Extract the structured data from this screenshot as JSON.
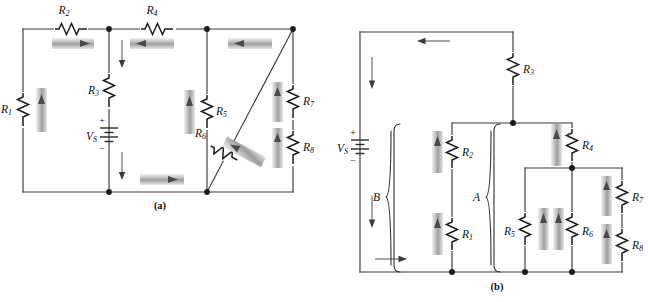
{
  "figure": {
    "panels": [
      {
        "id": "panel-a",
        "caption": "(a)",
        "source_label": "V",
        "source_sub": "S",
        "source_plus": "+",
        "source_minus": "−",
        "components": [
          {
            "name": "R1",
            "label": "R",
            "sub": "1",
            "current_direction": "up"
          },
          {
            "name": "R2",
            "label": "R",
            "sub": "2",
            "current_direction": "right"
          },
          {
            "name": "R3",
            "label": "R",
            "sub": "3",
            "current_direction": "down"
          },
          {
            "name": "R4",
            "label": "R",
            "sub": "4",
            "current_direction": "left"
          },
          {
            "name": "R5",
            "label": "R",
            "sub": "5",
            "current_direction": "up"
          },
          {
            "name": "R6",
            "label": "R",
            "sub": "6",
            "current_direction": "diagonal-up-right"
          },
          {
            "name": "R7",
            "label": "R",
            "sub": "7",
            "current_direction": "up"
          },
          {
            "name": "R8",
            "label": "R",
            "sub": "8",
            "current_direction": "up"
          }
        ],
        "branch_arrows": [
          {
            "name": "top-left-branch-arrow",
            "direction": "right"
          },
          {
            "name": "top-middle-branch-arrow",
            "direction": "left"
          },
          {
            "name": "top-right-branch-arrow",
            "direction": "left"
          },
          {
            "name": "bottom-middle-branch-arrow",
            "direction": "right"
          },
          {
            "name": "r3-upper-current-arrow",
            "direction": "down"
          },
          {
            "name": "r3-lower-current-arrow",
            "direction": "down"
          }
        ]
      },
      {
        "id": "panel-b",
        "caption": "(b)",
        "source_label": "V",
        "source_sub": "S",
        "source_plus": "+",
        "source_minus": "−",
        "group_labels": [
          {
            "name": "group-b",
            "text": "B"
          },
          {
            "name": "group-a",
            "text": "A"
          }
        ],
        "components": [
          {
            "name": "R1",
            "label": "R",
            "sub": "1",
            "current_direction": "up"
          },
          {
            "name": "R2",
            "label": "R",
            "sub": "2",
            "current_direction": "up"
          },
          {
            "name": "R3",
            "label": "R",
            "sub": "3",
            "current_direction": "none"
          },
          {
            "name": "R4",
            "label": "R",
            "sub": "4",
            "current_direction": "up"
          },
          {
            "name": "R5",
            "label": "R",
            "sub": "5",
            "current_direction": "up"
          },
          {
            "name": "R6",
            "label": "R",
            "sub": "6",
            "current_direction": "up"
          },
          {
            "name": "R7",
            "label": "R",
            "sub": "7",
            "current_direction": "up"
          },
          {
            "name": "R8",
            "label": "R",
            "sub": "8",
            "current_direction": "up"
          }
        ],
        "branch_arrows": [
          {
            "name": "top-rail-arrow",
            "direction": "left"
          },
          {
            "name": "source-upper-arrow",
            "direction": "down"
          },
          {
            "name": "source-lower-arrow",
            "direction": "down"
          },
          {
            "name": "bottom-rail-arrow",
            "direction": "right"
          }
        ]
      }
    ]
  },
  "colors": {
    "wire": "#3a3a3a",
    "resistor": "#1c1c1c",
    "arrow_fill": "#5a5a5a",
    "arrow_shadow": "#c8c8c8",
    "background": "#ffffff",
    "text": "#111111"
  }
}
